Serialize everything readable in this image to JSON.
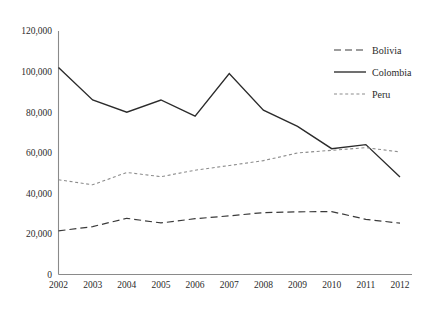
{
  "chart_data": {
    "type": "line",
    "title": "",
    "subtitle": "",
    "xlabel": "",
    "ylabel": "",
    "categories": [
      "2002",
      "2003",
      "2004",
      "2005",
      "2006",
      "2007",
      "2008",
      "2009",
      "2010",
      "2011",
      "2012"
    ],
    "x": [
      2002,
      2003,
      2004,
      2005,
      2006,
      2007,
      2008,
      2009,
      2010,
      2011,
      2012
    ],
    "xlim": [
      2002,
      2012
    ],
    "ylim": [
      0,
      120000
    ],
    "yticks": [
      0,
      20000,
      40000,
      60000,
      80000,
      100000,
      120000
    ],
    "ytick_labels": [
      "0",
      "20,000",
      "40,000",
      "60,000",
      "80,000",
      "100,000",
      "120,000"
    ],
    "grid": false,
    "legend_position": "top-right",
    "series": [
      {
        "name": "Bolivia",
        "style": "dashed",
        "color": "#3a3a3a",
        "values": [
          21500,
          23600,
          27700,
          25400,
          27500,
          28900,
          30500,
          30900,
          31000,
          27200,
          25300
        ]
      },
      {
        "name": "Colombia",
        "style": "solid",
        "color": "#2b2b2b",
        "values": [
          102000,
          86000,
          80000,
          86000,
          78000,
          99000,
          81000,
          73000,
          62000,
          64000,
          48000
        ]
      },
      {
        "name": "Peru",
        "style": "dotted",
        "color": "#8c8c8c",
        "values": [
          46700,
          44200,
          50300,
          48200,
          51400,
          53700,
          56100,
          59900,
          61200,
          62500,
          60400
        ]
      }
    ]
  },
  "legend": {
    "items": [
      {
        "label": "Bolivia"
      },
      {
        "label": "Colombia"
      },
      {
        "label": "Peru"
      }
    ]
  }
}
